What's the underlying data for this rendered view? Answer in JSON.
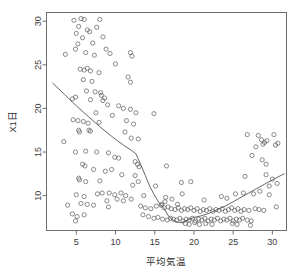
{
  "chart_data": {
    "type": "scatter",
    "title": "",
    "xlabel": "平均気温",
    "ylabel": "X1日",
    "xlim": [
      1.2,
      31.8
    ],
    "ylim": [
      6.0,
      31.0
    ],
    "xticks": [
      5,
      10,
      15,
      20,
      25,
      30
    ],
    "yticks": [
      10,
      15,
      20,
      25,
      30
    ],
    "xtick_labels": [
      "5",
      "10",
      "15",
      "20",
      "25",
      "30"
    ],
    "ytick_labels": [
      "10",
      "15",
      "20",
      "25",
      "30"
    ],
    "grid": false,
    "legend": null,
    "marker": "open-circle",
    "marker_color": "#5a5a5a",
    "trend_color": "#555555",
    "frame_color": "#6e6e6e",
    "background": "#ffffff",
    "series": [
      {
        "name": "observations",
        "points": [
          [
            3.6,
            26.2
          ],
          [
            4.7,
            30.1
          ],
          [
            5.3,
            29.4
          ],
          [
            5.0,
            28.6
          ],
          [
            5.6,
            30.3
          ],
          [
            6.0,
            30.2
          ],
          [
            6.4,
            29.0
          ],
          [
            5.2,
            27.4
          ],
          [
            4.9,
            26.8
          ],
          [
            5.8,
            28.1
          ],
          [
            6.7,
            28.8
          ],
          [
            7.1,
            27.5
          ],
          [
            6.2,
            26.4
          ],
          [
            7.6,
            29.3
          ],
          [
            8.0,
            30.2
          ],
          [
            7.3,
            26.1
          ],
          [
            8.4,
            28.2
          ],
          [
            8.8,
            26.8
          ],
          [
            9.3,
            26.3
          ],
          [
            10.0,
            25.1
          ],
          [
            11.9,
            26.4
          ],
          [
            12.1,
            26.0
          ],
          [
            5.5,
            24.5
          ],
          [
            6.0,
            24.4
          ],
          [
            6.4,
            24.6
          ],
          [
            6.8,
            24.3
          ],
          [
            5.9,
            23.3
          ],
          [
            7.0,
            23.1
          ],
          [
            7.9,
            24.1
          ],
          [
            11.6,
            23.6
          ],
          [
            11.9,
            23.0
          ],
          [
            6.3,
            22.0
          ],
          [
            7.4,
            21.9
          ],
          [
            8.2,
            21.5
          ],
          [
            8.6,
            21.2
          ],
          [
            4.5,
            21.1
          ],
          [
            4.9,
            21.3
          ],
          [
            6.8,
            21.0
          ],
          [
            8.1,
            21.8
          ],
          [
            8.4,
            20.9
          ],
          [
            9.0,
            20.4
          ],
          [
            10.4,
            20.3
          ],
          [
            11.0,
            20.0
          ],
          [
            11.9,
            19.9
          ],
          [
            7.5,
            19.5
          ],
          [
            9.6,
            19.2
          ],
          [
            12.6,
            19.5
          ],
          [
            14.9,
            19.4
          ],
          [
            4.6,
            18.7
          ],
          [
            5.2,
            18.6
          ],
          [
            5.9,
            18.5
          ],
          [
            6.5,
            18.3
          ],
          [
            7.9,
            18.4
          ],
          [
            11.4,
            18.6
          ],
          [
            12.3,
            18.2
          ],
          [
            3.4,
            16.2
          ],
          [
            5.3,
            17.5
          ],
          [
            5.4,
            17.3
          ],
          [
            6.6,
            17.5
          ],
          [
            6.8,
            17.4
          ],
          [
            11.2,
            17.3
          ],
          [
            12.0,
            16.6
          ],
          [
            12.9,
            16.5
          ],
          [
            26.8,
            17.0
          ],
          [
            28.2,
            16.9
          ],
          [
            28.6,
            16.4
          ],
          [
            29.3,
            16.3
          ],
          [
            30.2,
            17.0
          ],
          [
            30.7,
            16.0
          ],
          [
            29.0,
            16.1
          ],
          [
            28.8,
            15.9
          ],
          [
            27.9,
            15.6
          ],
          [
            30.4,
            15.8
          ],
          [
            4.9,
            15.0
          ],
          [
            6.2,
            15.1
          ],
          [
            7.6,
            15.0
          ],
          [
            9.1,
            14.9
          ],
          [
            9.9,
            14.4
          ],
          [
            10.4,
            14.3
          ],
          [
            5.8,
            13.6
          ],
          [
            6.1,
            13.4
          ],
          [
            7.2,
            13.0
          ],
          [
            12.5,
            13.9
          ],
          [
            12.8,
            13.6
          ],
          [
            13.0,
            13.3
          ],
          [
            16.5,
            13.4
          ],
          [
            27.4,
            14.6
          ],
          [
            28.7,
            14.1
          ],
          [
            29.2,
            13.6
          ],
          [
            5.3,
            12.0
          ],
          [
            5.4,
            11.8
          ],
          [
            6.2,
            11.6
          ],
          [
            8.0,
            11.7
          ],
          [
            12.5,
            12.3
          ],
          [
            12.9,
            11.6
          ],
          [
            18.4,
            11.5
          ],
          [
            19.6,
            11.6
          ],
          [
            26.5,
            12.2
          ],
          [
            29.2,
            12.4
          ],
          [
            30.0,
            11.9
          ],
          [
            30.6,
            11.4
          ],
          [
            29.6,
            11.1
          ],
          [
            5.0,
            10.1
          ],
          [
            6.0,
            9.9
          ],
          [
            7.7,
            10.2
          ],
          [
            8.3,
            10.3
          ],
          [
            9.2,
            10.3
          ],
          [
            9.9,
            10.1
          ],
          [
            10.7,
            10.3
          ],
          [
            11.3,
            10.0
          ],
          [
            8.9,
            9.4
          ],
          [
            10.2,
            9.6
          ],
          [
            11.0,
            9.4
          ],
          [
            12.0,
            9.6
          ],
          [
            15.1,
            11.1
          ],
          [
            16.4,
            9.8
          ],
          [
            17.2,
            9.6
          ],
          [
            18.5,
            10.2
          ],
          [
            21.3,
            9.5
          ],
          [
            23.5,
            9.9
          ],
          [
            24.2,
            9.7
          ],
          [
            25.3,
            10.2
          ],
          [
            26.3,
            10.3
          ],
          [
            27.6,
            10.2
          ],
          [
            28.4,
            10.5
          ],
          [
            29.6,
            10.1
          ],
          [
            3.9,
            8.9
          ],
          [
            5.6,
            9.1
          ],
          [
            6.4,
            9.0
          ],
          [
            7.2,
            8.9
          ],
          [
            9.1,
            8.7
          ],
          [
            13.2,
            8.8
          ],
          [
            13.8,
            8.6
          ],
          [
            14.5,
            8.5
          ],
          [
            15.2,
            8.8
          ],
          [
            15.8,
            8.9
          ],
          [
            16.2,
            8.6
          ],
          [
            16.7,
            8.7
          ],
          [
            17.1,
            8.5
          ],
          [
            17.6,
            8.4
          ],
          [
            18.0,
            8.6
          ],
          [
            18.4,
            8.3
          ],
          [
            18.8,
            8.5
          ],
          [
            19.2,
            8.4
          ],
          [
            19.6,
            8.6
          ],
          [
            20.0,
            8.3
          ],
          [
            20.4,
            8.5
          ],
          [
            20.8,
            8.2
          ],
          [
            21.2,
            8.4
          ],
          [
            21.6,
            8.3
          ],
          [
            22.0,
            8.5
          ],
          [
            22.4,
            8.2
          ],
          [
            22.8,
            8.4
          ],
          [
            23.2,
            8.3
          ],
          [
            23.6,
            8.5
          ],
          [
            24.0,
            8.2
          ],
          [
            24.4,
            8.4
          ],
          [
            24.8,
            8.6
          ],
          [
            25.2,
            8.3
          ],
          [
            25.6,
            8.5
          ],
          [
            26.0,
            8.2
          ],
          [
            26.4,
            8.4
          ],
          [
            27.0,
            8.3
          ],
          [
            27.8,
            8.5
          ],
          [
            28.3,
            8.4
          ],
          [
            28.9,
            8.3
          ],
          [
            30.5,
            8.7
          ],
          [
            4.5,
            7.9
          ],
          [
            5.1,
            7.6
          ],
          [
            6.0,
            7.8
          ],
          [
            13.5,
            7.8
          ],
          [
            14.2,
            7.6
          ],
          [
            14.9,
            7.4
          ],
          [
            15.4,
            7.5
          ],
          [
            16.0,
            7.3
          ],
          [
            16.6,
            7.2
          ],
          [
            17.0,
            7.4
          ],
          [
            17.4,
            7.3
          ],
          [
            17.8,
            7.2
          ],
          [
            18.2,
            7.4
          ],
          [
            18.6,
            7.1
          ],
          [
            19.0,
            7.3
          ],
          [
            19.4,
            7.2
          ],
          [
            19.8,
            7.4
          ],
          [
            20.2,
            7.1
          ],
          [
            20.6,
            7.3
          ],
          [
            21.0,
            7.2
          ],
          [
            21.4,
            7.4
          ],
          [
            21.8,
            7.1
          ],
          [
            22.2,
            7.3
          ],
          [
            22.6,
            7.2
          ],
          [
            23.0,
            7.4
          ],
          [
            23.4,
            7.1
          ],
          [
            23.8,
            7.3
          ],
          [
            24.2,
            7.2
          ],
          [
            24.6,
            7.4
          ],
          [
            25.0,
            7.1
          ],
          [
            25.4,
            7.3
          ],
          [
            25.8,
            7.2
          ],
          [
            26.2,
            7.4
          ],
          [
            26.8,
            7.2
          ],
          [
            27.3,
            7.1
          ],
          [
            18.9,
            6.8
          ],
          [
            19.4,
            6.7
          ],
          [
            20.1,
            6.9
          ],
          [
            20.7,
            6.7
          ],
          [
            21.5,
            6.8
          ],
          [
            22.3,
            6.7
          ],
          [
            24.9,
            6.8
          ],
          [
            25.5,
            6.7
          ],
          [
            27.2,
            6.6
          ],
          [
            4.9,
            7.1
          ],
          [
            12.2,
            11.2
          ],
          [
            13.6,
            10.0
          ],
          [
            15.9,
            9.0
          ],
          [
            16.3,
            9.3
          ],
          [
            17.9,
            9.0
          ],
          [
            9.5,
            13.0
          ],
          [
            8.7,
            12.8
          ],
          [
            10.8,
            12.4
          ]
        ]
      }
    ],
    "trend_line": {
      "name": "lowess-fit",
      "points": [
        [
          2.0,
          22.9
        ],
        [
          3.5,
          21.6
        ],
        [
          5.0,
          20.3
        ],
        [
          6.5,
          19.1
        ],
        [
          8.0,
          17.9
        ],
        [
          9.5,
          16.8
        ],
        [
          11.0,
          15.8
        ],
        [
          12.0,
          15.2
        ],
        [
          12.6,
          14.8
        ],
        [
          13.2,
          13.6
        ],
        [
          13.8,
          12.3
        ],
        [
          14.4,
          11.0
        ],
        [
          15.0,
          10.0
        ],
        [
          15.6,
          9.1
        ],
        [
          16.2,
          8.5
        ],
        [
          16.8,
          7.6
        ],
        [
          17.6,
          7.0
        ],
        [
          18.4,
          6.9
        ],
        [
          19.2,
          7.2
        ],
        [
          20.0,
          7.5
        ],
        [
          21.0,
          7.7
        ],
        [
          22.0,
          8.0
        ],
        [
          23.0,
          8.4
        ],
        [
          24.0,
          8.8
        ],
        [
          25.0,
          9.3
        ],
        [
          26.0,
          9.8
        ],
        [
          27.0,
          10.3
        ],
        [
          28.0,
          10.8
        ],
        [
          29.0,
          11.3
        ],
        [
          30.0,
          11.8
        ],
        [
          31.5,
          12.5
        ]
      ]
    }
  }
}
